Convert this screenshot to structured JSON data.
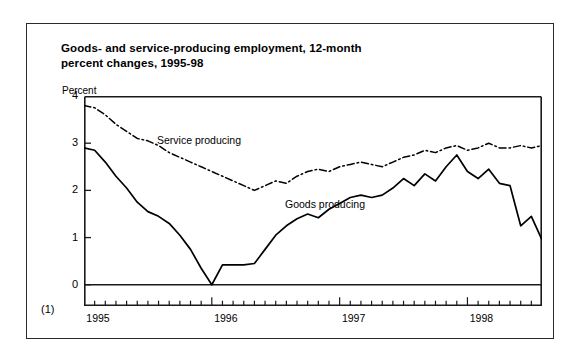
{
  "figure": {
    "title_line1": "Goods- and service-producing employment, 12-month",
    "title_line2": "percent changes, 1995-98",
    "footnote_marker": "(1)"
  },
  "chart_data": {
    "type": "line",
    "title": "Goods- and service-producing employment, 12-month percent changes, 1995-98",
    "xlabel": "",
    "ylabel": "Percent",
    "ylim": [
      -0.45,
      4
    ],
    "yticks": [
      0,
      1,
      2,
      3,
      4
    ],
    "ytick_labels": [
      "0",
      "1",
      "2",
      "3",
      "4"
    ],
    "xlim": [
      "1995-01",
      "1998-08"
    ],
    "xtick_labels": [
      "1995",
      "1996",
      "1997",
      "1998"
    ],
    "xtick_positions": [
      "1995-01",
      "1996-01",
      "1997-01",
      "1998-01"
    ],
    "minor_ticks": "monthly",
    "grid": false,
    "legend": "inline-annotations",
    "zero_line": true,
    "x": [
      "1995-01",
      "1995-02",
      "1995-03",
      "1995-04",
      "1995-05",
      "1995-06",
      "1995-07",
      "1995-08",
      "1995-09",
      "1995-10",
      "1995-11",
      "1995-12",
      "1996-01",
      "1996-02",
      "1996-03",
      "1996-04",
      "1996-05",
      "1996-06",
      "1996-07",
      "1996-08",
      "1996-09",
      "1996-10",
      "1996-11",
      "1996-12",
      "1997-01",
      "1997-02",
      "1997-03",
      "1997-04",
      "1997-05",
      "1997-06",
      "1997-07",
      "1997-08",
      "1997-09",
      "1997-10",
      "1997-11",
      "1997-12",
      "1998-01",
      "1998-02",
      "1998-03",
      "1998-04",
      "1998-05",
      "1998-06",
      "1998-07",
      "1998-08"
    ],
    "series": [
      {
        "name": "Goods producing",
        "style": "solid",
        "color": "#000000",
        "label_position": {
          "x": "1996-10",
          "y": 1.35
        },
        "values": [
          2.9,
          2.85,
          2.6,
          2.3,
          2.05,
          1.75,
          1.55,
          1.45,
          1.3,
          1.05,
          0.75,
          0.35,
          0.0,
          0.42,
          0.42,
          0.42,
          0.45,
          0.75,
          1.05,
          1.25,
          1.4,
          1.5,
          1.42,
          1.6,
          1.72,
          1.85,
          1.9,
          1.85,
          1.9,
          2.05,
          2.25,
          2.1,
          2.35,
          2.2,
          2.5,
          2.75,
          2.4,
          2.25,
          2.45,
          2.15,
          2.1,
          1.25,
          1.45,
          0.95
        ]
      },
      {
        "name": "Service producing",
        "style": "dash-dot",
        "color": "#000000",
        "label_position": {
          "x": "1995-07",
          "y": 2.95
        },
        "values": [
          3.8,
          3.75,
          3.6,
          3.4,
          3.25,
          3.1,
          3.05,
          2.95,
          2.8,
          2.7,
          2.6,
          2.5,
          2.4,
          2.3,
          2.2,
          2.1,
          2.0,
          2.1,
          2.2,
          2.15,
          2.3,
          2.4,
          2.45,
          2.4,
          2.5,
          2.55,
          2.6,
          2.55,
          2.5,
          2.6,
          2.7,
          2.75,
          2.85,
          2.8,
          2.9,
          2.95,
          2.85,
          2.9,
          3.0,
          2.9,
          2.9,
          2.95,
          2.9,
          2.95
        ]
      }
    ]
  }
}
